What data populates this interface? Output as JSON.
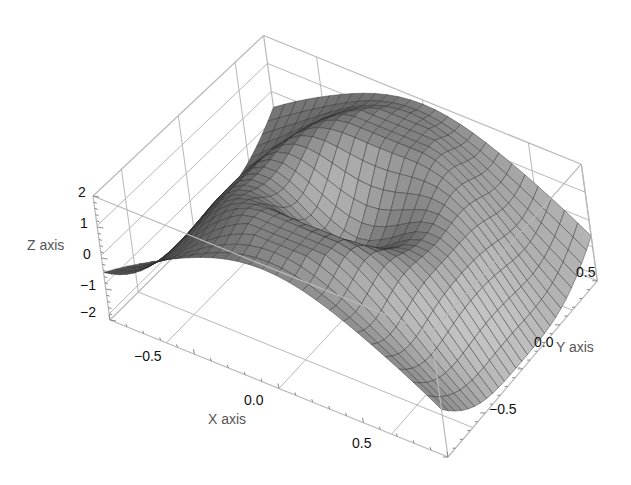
{
  "chart_data": {
    "type": "surface3d",
    "title": "",
    "xlabel": "X axis",
    "ylabel": "Y axis",
    "zlabel": "Z axis",
    "xlim": [
      -0.75,
      0.75
    ],
    "ylim": [
      -0.75,
      0.75
    ],
    "zlim": [
      -2.2,
      2.0
    ],
    "x_ticks": [
      "-0.5",
      "0.0",
      "0.5"
    ],
    "y_ticks": [
      "0.5",
      "0.0",
      "-0.5"
    ],
    "z_ticks": [
      "2",
      "1",
      "0",
      "-1",
      "-2"
    ],
    "mesh_lines": 26,
    "shading": "grayscale",
    "box": true
  },
  "labels": {
    "z_axis": "Z axis",
    "x_axis": "X axis",
    "y_axis": "Y axis",
    "z_ticks": [
      "2",
      "1",
      "0",
      "−1",
      "−2"
    ],
    "x_ticks": [
      "−0.5",
      "0.0",
      "0.5"
    ],
    "y_ticks": [
      "0.5",
      "0.0",
      "−0.5"
    ]
  },
  "colors": {
    "box": "#b8b8b8",
    "mesh": "#2a2a2a",
    "surface_light": "#e6e6e6",
    "surface_dark": "#141414"
  }
}
